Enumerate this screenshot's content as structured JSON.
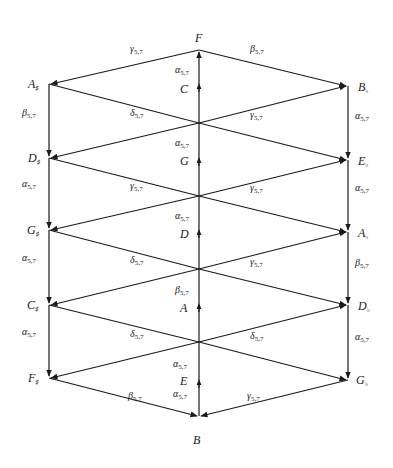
{
  "diagram": {
    "nodes": {
      "F": {
        "label": "F",
        "accidental": ""
      },
      "C": {
        "label": "C",
        "accidental": ""
      },
      "G": {
        "label": "G",
        "accidental": ""
      },
      "D": {
        "label": "D",
        "accidental": ""
      },
      "A": {
        "label": "A",
        "accidental": ""
      },
      "E": {
        "label": "E",
        "accidental": ""
      },
      "B": {
        "label": "B",
        "accidental": ""
      },
      "Asharp": {
        "label": "A",
        "accidental": "♯"
      },
      "Dsharp": {
        "label": "D",
        "accidental": "♯"
      },
      "Gsharp": {
        "label": "G",
        "accidental": "♯"
      },
      "Csharp": {
        "label": "C",
        "accidental": "♯"
      },
      "Fsharp": {
        "label": "F",
        "accidental": "♯"
      },
      "Bflat": {
        "label": "B",
        "accidental": "♭"
      },
      "Eflat": {
        "label": "E",
        "accidental": "♭"
      },
      "Aflat": {
        "label": "A",
        "accidental": "♭"
      },
      "Dflat": {
        "label": "D",
        "accidental": "♭"
      },
      "Gflat": {
        "label": "G",
        "accidental": "♭"
      }
    },
    "edge_labels": {
      "alpha": {
        "greek": "α",
        "sub": "5,7"
      },
      "beta": {
        "greek": "β",
        "sub": "5,7"
      },
      "gamma": {
        "greek": "γ",
        "sub": "5,7"
      },
      "delta": {
        "greek": "δ",
        "sub": "5,7"
      }
    },
    "edges": [
      {
        "from": "F",
        "to": "Asharp",
        "label": "γ5,7"
      },
      {
        "from": "F",
        "to": "Bflat",
        "label": "β5,7"
      },
      {
        "from": "Asharp",
        "to": "Dsharp",
        "label": "β5,7"
      },
      {
        "from": "Bflat",
        "to": "Eflat",
        "label": "α5,7"
      },
      {
        "from": "Dsharp",
        "to": "Gsharp",
        "label": "α5,7"
      },
      {
        "from": "Eflat",
        "to": "Aflat",
        "label": "α5,7"
      },
      {
        "from": "Gsharp",
        "to": "Csharp",
        "label": "α5,7"
      },
      {
        "from": "Aflat",
        "to": "Dflat",
        "label": "β5,7"
      },
      {
        "from": "Csharp",
        "to": "Fsharp",
        "label": "α5,7"
      },
      {
        "from": "Dflat",
        "to": "Gflat",
        "label": "α5,7"
      },
      {
        "from": "Fsharp",
        "to": "B",
        "label": "β5,7"
      },
      {
        "from": "Gflat",
        "to": "B",
        "label": "γ5,7"
      },
      {
        "from": "C",
        "to": "F",
        "label": "α5,7"
      },
      {
        "from": "G",
        "to": "C",
        "label": "α5,7"
      },
      {
        "from": "D",
        "to": "G",
        "label": "α5,7"
      },
      {
        "from": "A",
        "to": "D",
        "label": "β5,7"
      },
      {
        "from": "E",
        "to": "A",
        "label": "α5,7"
      },
      {
        "from": "B",
        "to": "E",
        "label": "α5,7"
      },
      {
        "from": "Asharp",
        "to": "center-1",
        "label": "δ5,7"
      },
      {
        "from": "center-1",
        "to": "Bflat",
        "label": "γ5,7"
      },
      {
        "from": "Dsharp",
        "to": "center-2",
        "label": "γ5,7"
      },
      {
        "from": "center-2",
        "to": "Eflat",
        "label": "γ5,7"
      },
      {
        "from": "Gsharp",
        "to": "center-3",
        "label": "δ5,7"
      },
      {
        "from": "center-3",
        "to": "Aflat",
        "label": "γ5,7"
      },
      {
        "from": "Csharp",
        "to": "center-4",
        "label": "δ5,7"
      },
      {
        "from": "center-4",
        "to": "Dflat",
        "label": "δ5,7"
      }
    ]
  }
}
